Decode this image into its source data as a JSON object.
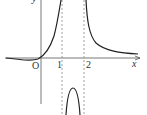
{
  "graph": {
    "axes": {
      "x_label": "x",
      "y_label": "y",
      "origin_label": "O"
    },
    "ticks": [
      "1",
      "2"
    ],
    "asymptotes": [
      {
        "x": 1,
        "style": "dashed"
      },
      {
        "x": 2,
        "style": "dashed"
      }
    ],
    "curve_color": "#222222",
    "axis_color": "#555555"
  }
}
